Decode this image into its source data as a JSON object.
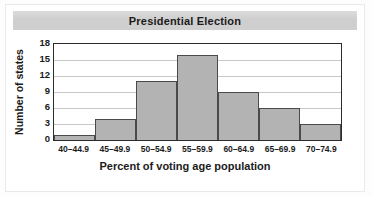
{
  "chart_data": {
    "type": "bar",
    "title": "Presidential Election",
    "xlabel": "Percent of voting age population",
    "ylabel": "Number of states",
    "categories": [
      "40–44.9",
      "45–49.9",
      "50–54.9",
      "55–59.9",
      "60–64.9",
      "65–69.9",
      "70–74.9"
    ],
    "values": [
      1,
      4,
      11,
      16,
      9,
      6,
      3
    ],
    "yticks": [
      0,
      3,
      6,
      9,
      12,
      15,
      18
    ],
    "ylim": [
      0,
      18
    ],
    "grid": "horizontal",
    "legend": "none",
    "colors": {
      "bar_fill": "#b3b3b3",
      "bar_edge": "#4a4a4a",
      "axis": "#2c2c2c",
      "gridline": "#c8c8c8",
      "title_band": "#cfcfcf",
      "text": "#1b1b1b",
      "plot_background": "#ffffff"
    }
  }
}
